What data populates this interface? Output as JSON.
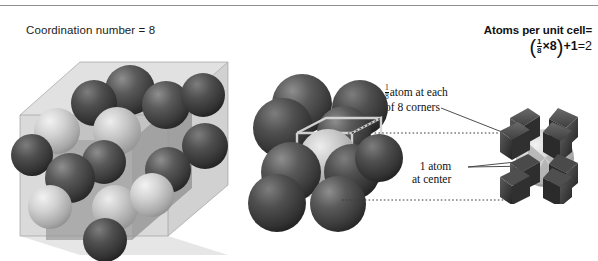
{
  "figure": {
    "title_left": "Coordination number = 8",
    "right_heading": "Atoms per unit cell=",
    "formula": {
      "open_paren": "(",
      "frac_num": "1",
      "frac_den": "8",
      "times": "×",
      "multiplier": "8",
      "close_paren": ")",
      "plus": "+",
      "addend": "1",
      "equals": "=",
      "result": "2",
      "plain": "(1/8 × 8) + 1 = 2"
    },
    "annotations": [
      {
        "id": "corners",
        "frac_num": "1",
        "frac_den": "8",
        "line1": "atom at each",
        "line2": "of 8 corners"
      },
      {
        "id": "center",
        "line1": "1 atom",
        "line2": "at center"
      }
    ],
    "colors": {
      "background": "#ffffff",
      "rule": "#8e8e8e",
      "dark_sphere": "#454545",
      "light_sphere": "#c8c8c8",
      "cube_face": "#b9b9b9",
      "text": "#111111",
      "leader": "#4a4a4a"
    },
    "panels": [
      {
        "id": "coordination-diagram",
        "label": "Coordination number = 8",
        "atoms_shown": 14,
        "cube_planes": 3
      },
      {
        "id": "bcc-space-filling",
        "label": "Body-centered cubic packed spheres",
        "corner_atoms": 8,
        "center_atoms": 1
      },
      {
        "id": "bcc-unit-cell",
        "label": "Body-centered cubic unit cell",
        "corner_octants": 8,
        "center_atoms": 1
      }
    ]
  }
}
